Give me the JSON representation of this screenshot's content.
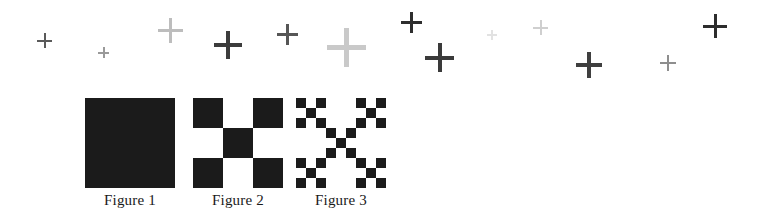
{
  "page": {
    "background_color": "#ffffff",
    "width": 759,
    "height": 212
  },
  "plus_marks": {
    "description": "Scattered plus / cross marks across the top band",
    "count": 13,
    "items": [
      {
        "id": "plus-1",
        "x": 37,
        "y": 33,
        "size": 15,
        "thickness": 2,
        "color": "#5a5a5a"
      },
      {
        "id": "plus-2",
        "x": 98,
        "y": 47,
        "size": 11,
        "thickness": 2,
        "color": "#9a9a9a"
      },
      {
        "id": "plus-3",
        "x": 158,
        "y": 18,
        "size": 25,
        "thickness": 3,
        "color": "#bdbdbd"
      },
      {
        "id": "plus-4",
        "x": 214,
        "y": 31,
        "size": 28,
        "thickness": 4,
        "color": "#3c3c3c"
      },
      {
        "id": "plus-5",
        "x": 277,
        "y": 24,
        "size": 21,
        "thickness": 3,
        "color": "#565656"
      },
      {
        "id": "plus-6",
        "x": 327,
        "y": 28,
        "size": 39,
        "thickness": 5,
        "color": "#c9c9c9"
      },
      {
        "id": "plus-7",
        "x": 401,
        "y": 12,
        "size": 21,
        "thickness": 3,
        "color": "#2e2e2e"
      },
      {
        "id": "plus-8",
        "x": 425,
        "y": 43,
        "size": 29,
        "thickness": 4,
        "color": "#3a3a3a"
      },
      {
        "id": "plus-9",
        "x": 533,
        "y": 20,
        "size": 15,
        "thickness": 2,
        "color": "#cfcfcf"
      },
      {
        "id": "plus-10",
        "x": 576,
        "y": 52,
        "size": 26,
        "thickness": 4,
        "color": "#3f3f3f"
      },
      {
        "id": "plus-11",
        "x": 660,
        "y": 55,
        "size": 16,
        "thickness": 2,
        "color": "#8e8e8e"
      },
      {
        "id": "plus-12",
        "x": 703,
        "y": 14,
        "size": 24,
        "thickness": 3,
        "color": "#2d2d2d"
      },
      {
        "id": "plus-13",
        "x": 487,
        "y": 30,
        "size": 10,
        "thickness": 2,
        "color": "#e2e2e2"
      }
    ]
  },
  "figures": {
    "fill_color": "#1b1b1b",
    "items": [
      {
        "id": "figure-1",
        "caption": "Figure 1",
        "left": 85,
        "iteration": 0,
        "grid": 1,
        "pattern": [
          [
            1
          ]
        ]
      },
      {
        "id": "figure-2",
        "caption": "Figure 2",
        "left": 193,
        "iteration": 1,
        "grid": 3,
        "pattern": [
          [
            1,
            0,
            1
          ],
          [
            0,
            1,
            0
          ],
          [
            1,
            0,
            1
          ]
        ]
      },
      {
        "id": "figure-3",
        "caption": "Figure 3",
        "left": 296,
        "iteration": 2,
        "grid": 9,
        "pattern": [
          [
            1,
            0,
            1,
            0,
            0,
            0,
            1,
            0,
            1
          ],
          [
            0,
            1,
            0,
            0,
            0,
            0,
            0,
            1,
            0
          ],
          [
            1,
            0,
            1,
            0,
            0,
            0,
            1,
            0,
            1
          ],
          [
            0,
            0,
            0,
            1,
            0,
            1,
            0,
            0,
            0
          ],
          [
            0,
            0,
            0,
            0,
            1,
            0,
            0,
            0,
            0
          ],
          [
            0,
            0,
            0,
            1,
            0,
            1,
            0,
            0,
            0
          ],
          [
            1,
            0,
            1,
            0,
            0,
            0,
            1,
            0,
            1
          ],
          [
            0,
            1,
            0,
            0,
            0,
            0,
            0,
            1,
            0
          ],
          [
            1,
            0,
            1,
            0,
            0,
            0,
            1,
            0,
            1
          ]
        ]
      }
    ]
  }
}
